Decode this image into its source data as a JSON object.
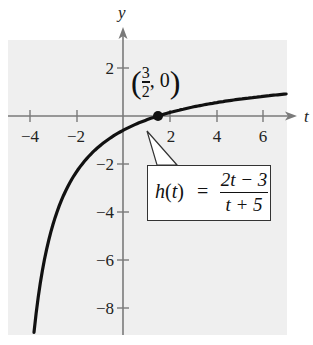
{
  "chart_data": {
    "type": "line",
    "title": "",
    "function_label": "h(t) = (2t - 3)/(t + 5)",
    "function_parts": {
      "name": "h",
      "var": "t",
      "numerator": "2t − 3",
      "denominator": "t + 5",
      "equals": "="
    },
    "xlabel": "t",
    "ylabel": "y",
    "xlim": [
      -4.9,
      7.0
    ],
    "ylim": [
      -9.0,
      3.2
    ],
    "x_ticks": [
      -4,
      -2,
      2,
      4,
      6
    ],
    "x_tick_labels": [
      "−4",
      "−2",
      "2",
      "4",
      "6"
    ],
    "y_ticks": [
      2,
      -2,
      -4,
      -6,
      -8
    ],
    "y_tick_labels": [
      "2",
      "−2",
      "−4",
      "−6",
      "−8"
    ],
    "grid": false,
    "series": [
      {
        "name": "h(t)",
        "x": [
          -3.82,
          -3.5,
          -3.0,
          -2.5,
          -2.0,
          -1.5,
          -1.0,
          0.0,
          1.0,
          1.5,
          2.0,
          3.0,
          4.0,
          5.0,
          6.0,
          7.0
        ],
        "values": [
          -9.0,
          -6.67,
          -4.5,
          -3.2,
          -2.33,
          -1.71,
          -1.25,
          -0.6,
          -0.17,
          0.0,
          0.14,
          0.38,
          0.56,
          0.7,
          0.82,
          0.92
        ]
      }
    ],
    "annotations": [
      {
        "type": "point",
        "x": 1.5,
        "y": 0,
        "label_num": "3",
        "label_den": "2",
        "label_rest": ", 0",
        "open": "(",
        "close": ")"
      }
    ],
    "colors": {
      "background_panel": "#efefef",
      "curve": "#111111",
      "axis": "#777777"
    }
  }
}
